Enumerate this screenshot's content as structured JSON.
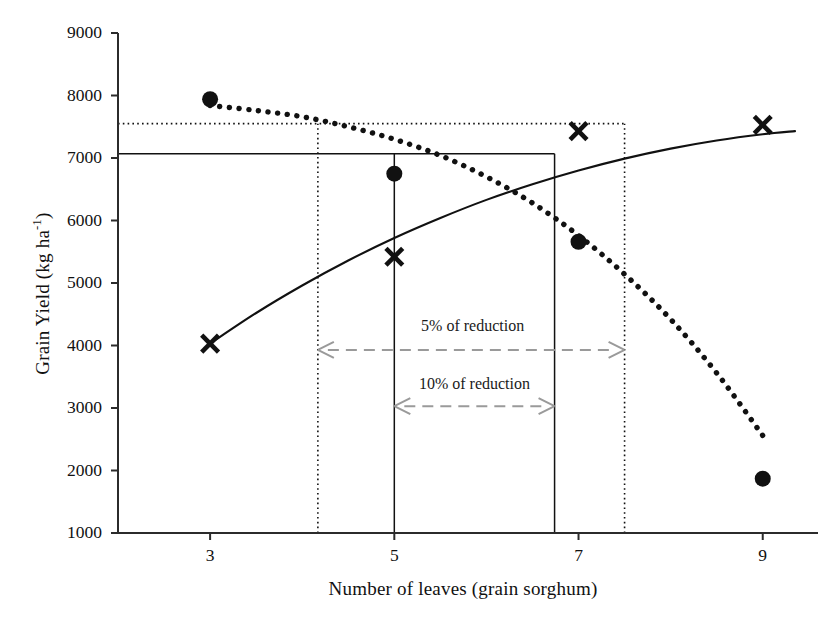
{
  "chart_data": {
    "type": "scatter",
    "title": "",
    "xlabel": "Number of leaves (grain sorghum)",
    "ylabel": "Grain Yield (kg ha-1)",
    "ylabel_parts": {
      "main": "Grain Yield (kg ha",
      "sup": "-1",
      "tail": ")"
    },
    "xlim": [
      2.0,
      9.6
    ],
    "ylim": [
      1000,
      9000
    ],
    "xticks": [
      3,
      5,
      7,
      9
    ],
    "xtick_labels": [
      "3",
      "5",
      "7",
      "9"
    ],
    "yticks": [
      1000,
      2000,
      3000,
      4000,
      5000,
      6000,
      7000,
      8000,
      9000
    ],
    "ytick_labels": [
      "1000",
      "2000",
      "3000",
      "4000",
      "5000",
      "6000",
      "7000",
      "8000",
      "9000"
    ],
    "grid": false,
    "legend": null,
    "series": [
      {
        "name": "filled-circle-series",
        "marker": "filled-circle",
        "marker_color": "#111111",
        "x": [
          3,
          5,
          7,
          9
        ],
        "values": [
          7940,
          6750,
          5660,
          1870
        ],
        "fit_curve": {
          "style": "dotted",
          "color": "#111111",
          "points": [
            [
              3.0,
              7840
            ],
            [
              3.5,
              7760
            ],
            [
              4.0,
              7660
            ],
            [
              4.5,
              7500
            ],
            [
              5.0,
              7300
            ],
            [
              5.5,
              7040
            ],
            [
              6.0,
              6700
            ],
            [
              6.5,
              6280
            ],
            [
              7.0,
              5760
            ],
            [
              7.5,
              5140
            ],
            [
              8.0,
              4420
            ],
            [
              8.5,
              3560
            ],
            [
              9.0,
              2560
            ]
          ]
        }
      },
      {
        "name": "cross-series",
        "marker": "x-cross",
        "marker_color": "#111111",
        "x": [
          3,
          5,
          7,
          9
        ],
        "values": [
          4030,
          5420,
          7430,
          7530
        ],
        "fit_curve": {
          "style": "solid",
          "color": "#111111",
          "points": [
            [
              3.0,
              4030
            ],
            [
              3.5,
              4520
            ],
            [
              4.0,
              4960
            ],
            [
              4.5,
              5360
            ],
            [
              5.0,
              5720
            ],
            [
              5.5,
              6040
            ],
            [
              6.0,
              6330
            ],
            [
              6.5,
              6580
            ],
            [
              7.0,
              6800
            ],
            [
              7.5,
              6990
            ],
            [
              8.0,
              7150
            ],
            [
              8.5,
              7280
            ],
            [
              9.0,
              7380
            ],
            [
              9.35,
              7430
            ]
          ]
        }
      }
    ],
    "reference_lines": [
      {
        "name": "dotted-horizontal-7550",
        "orientation": "horizontal",
        "value": 7550,
        "style": "dotted",
        "color": "#111111",
        "x_from": 2.0,
        "x_to": 7.5
      },
      {
        "name": "solid-horizontal-7070",
        "orientation": "horizontal",
        "value": 7070,
        "style": "solid",
        "color": "#111111",
        "x_from": 2.0,
        "x_to": 6.74
      },
      {
        "name": "dotted-vertical-left-4.17",
        "orientation": "vertical",
        "value": 4.17,
        "style": "dotted",
        "color": "#111111",
        "y_from": 1000,
        "y_to": 7550
      },
      {
        "name": "dotted-vertical-right-7.5",
        "orientation": "vertical",
        "value": 7.5,
        "style": "dotted",
        "color": "#111111",
        "y_from": 1000,
        "y_to": 7550
      },
      {
        "name": "solid-vertical-left-5",
        "orientation": "vertical",
        "value": 5.0,
        "style": "solid",
        "color": "#111111",
        "y_from": 1000,
        "y_to": 7070
      },
      {
        "name": "solid-vertical-right-6.74",
        "orientation": "vertical",
        "value": 6.74,
        "style": "solid",
        "color": "#111111",
        "y_from": 1000,
        "y_to": 7070
      }
    ],
    "annotations": [
      {
        "name": "reduction-5-percent",
        "text": "5% of reduction",
        "text_x": 5.85,
        "text_y": 4320,
        "arrow": {
          "x_from": 4.17,
          "x_to": 7.5,
          "y": 3930,
          "style": "dashed",
          "color": "#9a9a9a",
          "double_headed": true
        }
      },
      {
        "name": "reduction-10-percent",
        "text": "10% of reduction",
        "text_x": 5.87,
        "text_y": 3390,
        "arrow": {
          "x_from": 5.0,
          "x_to": 6.74,
          "y": 3030,
          "style": "dashed",
          "color": "#9a9a9a",
          "double_headed": true
        }
      }
    ],
    "axis_color": "#2b2b2b"
  }
}
